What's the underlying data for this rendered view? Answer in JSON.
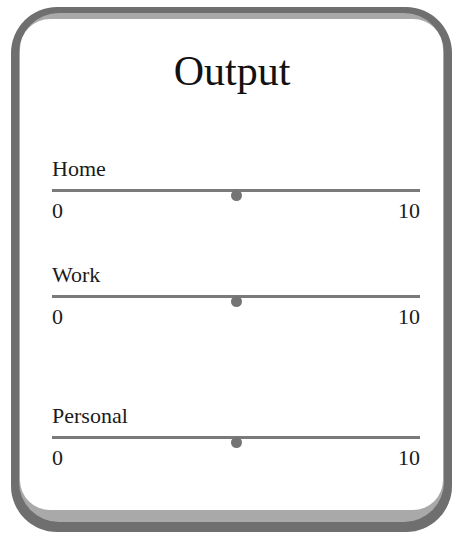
{
  "panel": {
    "title": "Output"
  },
  "sliders": [
    {
      "label": "Home",
      "min": "0",
      "max": "10",
      "value": 5
    },
    {
      "label": "Work",
      "min": "0",
      "max": "10",
      "value": 5
    },
    {
      "label": "Personal",
      "min": "0",
      "max": "10",
      "value": 5
    }
  ],
  "colors": {
    "frame_outer": "#6f6f6f",
    "frame_inner": "#a9a9a9",
    "track": "#7a7a7a",
    "thumb": "#747474",
    "text": "#111111"
  }
}
